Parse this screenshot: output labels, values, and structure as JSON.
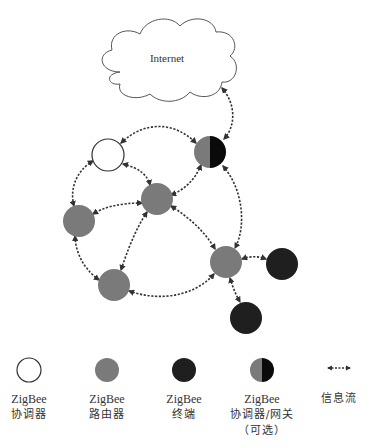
{
  "diagram": {
    "cloud": {
      "label": "Internet"
    },
    "colors": {
      "coordinator_fill": "#ffffff",
      "coordinator_stroke": "#333333",
      "router": "#7a7a7a",
      "end_device": "#1f1f1f",
      "gateway_left": "#7a7a7a",
      "gateway_right": "#0a0a0a",
      "link": "#333333"
    },
    "nodes": [
      {
        "id": "coordinator",
        "type": "coordinator",
        "x": 108,
        "y": 155
      },
      {
        "id": "gateway",
        "type": "gateway",
        "x": 210,
        "y": 152
      },
      {
        "id": "router-center",
        "type": "router",
        "x": 157,
        "y": 199
      },
      {
        "id": "router-left",
        "type": "router",
        "x": 79,
        "y": 221
      },
      {
        "id": "router-lower",
        "type": "router",
        "x": 114,
        "y": 285
      },
      {
        "id": "router-right",
        "type": "router",
        "x": 226,
        "y": 262
      },
      {
        "id": "end-right",
        "type": "end",
        "x": 282,
        "y": 264
      },
      {
        "id": "end-bottom",
        "type": "end",
        "x": 246,
        "y": 318
      }
    ],
    "links": [
      {
        "from": "internet",
        "to": "gateway"
      },
      {
        "from": "coordinator",
        "to": "gateway"
      },
      {
        "from": "coordinator",
        "to": "router-center"
      },
      {
        "from": "coordinator",
        "to": "router-left"
      },
      {
        "from": "gateway",
        "to": "router-center"
      },
      {
        "from": "gateway",
        "to": "router-right"
      },
      {
        "from": "router-center",
        "to": "router-left"
      },
      {
        "from": "router-center",
        "to": "router-lower"
      },
      {
        "from": "router-center",
        "to": "router-right"
      },
      {
        "from": "router-left",
        "to": "router-lower"
      },
      {
        "from": "router-lower",
        "to": "router-right"
      },
      {
        "from": "router-right",
        "to": "end-right"
      },
      {
        "from": "router-right",
        "to": "end-bottom"
      }
    ]
  },
  "legend": {
    "items": [
      {
        "symbol": "coordinator",
        "line1": "ZigBee",
        "line2": "协调器",
        "line3": ""
      },
      {
        "symbol": "router",
        "line1": "ZigBee",
        "line2": "路由器",
        "line3": ""
      },
      {
        "symbol": "end-device",
        "line1": "ZigBee",
        "line2": "终端",
        "line3": ""
      },
      {
        "symbol": "gateway",
        "line1": "ZigBee",
        "line2": "协调器/网关",
        "line3": "（可选）"
      },
      {
        "symbol": "info-flow",
        "line1": "信息流",
        "line2": "",
        "line3": ""
      }
    ]
  }
}
